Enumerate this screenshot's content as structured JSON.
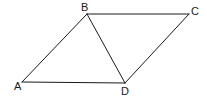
{
  "diagram": {
    "type": "geometry",
    "shape": "parallelogram with diagonal",
    "stroke_color": "#1a1a1a",
    "background": "#ffffff",
    "points": {
      "A": {
        "label": "A",
        "x": 22,
        "y": 82
      },
      "B": {
        "label": "B",
        "x": 87,
        "y": 14
      },
      "C": {
        "label": "C",
        "x": 189,
        "y": 14
      },
      "D": {
        "label": "D",
        "x": 125,
        "y": 83
      }
    },
    "segments": [
      {
        "from": "A",
        "to": "B"
      },
      {
        "from": "B",
        "to": "C"
      },
      {
        "from": "C",
        "to": "D"
      },
      {
        "from": "D",
        "to": "A"
      },
      {
        "from": "B",
        "to": "D"
      }
    ],
    "labels": {
      "A": "A",
      "B": "B",
      "C": "C",
      "D": "D"
    }
  }
}
